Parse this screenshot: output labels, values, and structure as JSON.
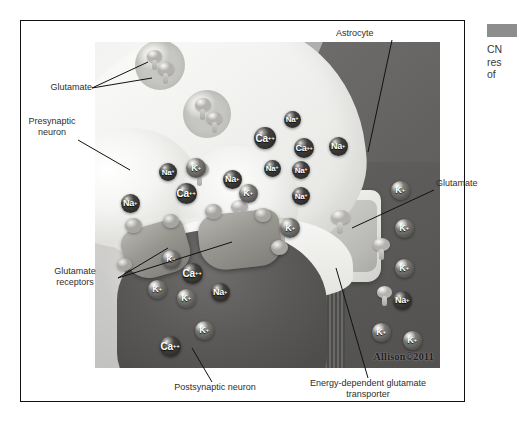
{
  "figure": {
    "signature": "Allison©2011",
    "margin_note": {
      "line1": "CN",
      "line2": "res",
      "line3": "of "
    }
  },
  "labels": {
    "glutamate_left": "Glutamate",
    "presynaptic_neuron": "Presynaptic\nneuron",
    "glutamate_receptors": "Glutamate\nreceptors",
    "postsynaptic_neuron": "Postsynaptic neuron",
    "astrocyte": "Astrocyte",
    "glutamate_right": "Glutamate",
    "transporter": "Energy-dependent glutamate\ntransporter"
  },
  "ions": [
    {
      "name": "na-1",
      "species": "Na",
      "charge": "+",
      "x": 292,
      "y": 119,
      "d": 17,
      "tone": "dk"
    },
    {
      "name": "ca-1",
      "species": "Ca",
      "charge": "++",
      "x": 265,
      "y": 138,
      "d": 22,
      "tone": "dk"
    },
    {
      "name": "ca-2",
      "species": "Ca",
      "charge": "++",
      "x": 304,
      "y": 148,
      "d": 20,
      "tone": "dk"
    },
    {
      "name": "na-2",
      "species": "Na",
      "charge": "+",
      "x": 338,
      "y": 146,
      "d": 19,
      "tone": "dk"
    },
    {
      "name": "na-3",
      "species": "Na",
      "charge": "+",
      "x": 272,
      "y": 168,
      "d": 17,
      "tone": "dk"
    },
    {
      "name": "na-4",
      "species": "Na",
      "charge": "+",
      "x": 301,
      "y": 170,
      "d": 18,
      "tone": "dk"
    },
    {
      "name": "na-5",
      "species": "Na",
      "charge": "+",
      "x": 168,
      "y": 172,
      "d": 18,
      "tone": "dk"
    },
    {
      "name": "k-1",
      "species": "K",
      "charge": "+",
      "x": 196,
      "y": 168,
      "d": 20,
      "tone": "lt"
    },
    {
      "name": "na-6",
      "species": "Na",
      "charge": "+",
      "x": 232,
      "y": 179,
      "d": 19,
      "tone": "dk"
    },
    {
      "name": "ca-3",
      "species": "Ca",
      "charge": "++",
      "x": 186,
      "y": 193,
      "d": 21,
      "tone": "dk"
    },
    {
      "name": "k-2",
      "species": "K",
      "charge": "+",
      "x": 248,
      "y": 193,
      "d": 19,
      "tone": "lt"
    },
    {
      "name": "na-7",
      "species": "Na",
      "charge": "+",
      "x": 130,
      "y": 203,
      "d": 19,
      "tone": "dk"
    },
    {
      "name": "na-8",
      "species": "Na",
      "charge": "+",
      "x": 301,
      "y": 196,
      "d": 18,
      "tone": "dk"
    },
    {
      "name": "k-3",
      "species": "K",
      "charge": "+",
      "x": 290,
      "y": 228,
      "d": 20,
      "tone": "lt"
    },
    {
      "name": "k-4",
      "species": "K",
      "charge": "+",
      "x": 400,
      "y": 190,
      "d": 19,
      "tone": "lt"
    },
    {
      "name": "k-5",
      "species": "K",
      "charge": "+",
      "x": 404,
      "y": 228,
      "d": 19,
      "tone": "lt"
    },
    {
      "name": "k-6",
      "species": "K",
      "charge": "+",
      "x": 404,
      "y": 268,
      "d": 19,
      "tone": "lt"
    },
    {
      "name": "na-9",
      "species": "Na",
      "charge": "+",
      "x": 402,
      "y": 300,
      "d": 19,
      "tone": "dk"
    },
    {
      "name": "k-7",
      "species": "K",
      "charge": "+",
      "x": 381,
      "y": 332,
      "d": 19,
      "tone": "lt"
    },
    {
      "name": "k-8",
      "species": "K",
      "charge": "+",
      "x": 412,
      "y": 340,
      "d": 19,
      "tone": "lt"
    },
    {
      "name": "k-9",
      "species": "K",
      "charge": "+",
      "x": 171,
      "y": 259,
      "d": 19,
      "tone": "lt"
    },
    {
      "name": "ca-4",
      "species": "Ca",
      "charge": "++",
      "x": 192,
      "y": 273,
      "d": 21,
      "tone": "dk"
    },
    {
      "name": "k-10",
      "species": "K",
      "charge": "+",
      "x": 157,
      "y": 289,
      "d": 19,
      "tone": "lt"
    },
    {
      "name": "k-11",
      "species": "K",
      "charge": "+",
      "x": 186,
      "y": 298,
      "d": 19,
      "tone": "lt"
    },
    {
      "name": "na-10",
      "species": "Na",
      "charge": "+",
      "x": 220,
      "y": 292,
      "d": 19,
      "tone": "dk"
    },
    {
      "name": "k-12",
      "species": "K",
      "charge": "+",
      "x": 204,
      "y": 330,
      "d": 19,
      "tone": "lt"
    },
    {
      "name": "ca-5",
      "species": "Ca",
      "charge": "++",
      "x": 170,
      "y": 346,
      "d": 21,
      "tone": "dk"
    }
  ]
}
